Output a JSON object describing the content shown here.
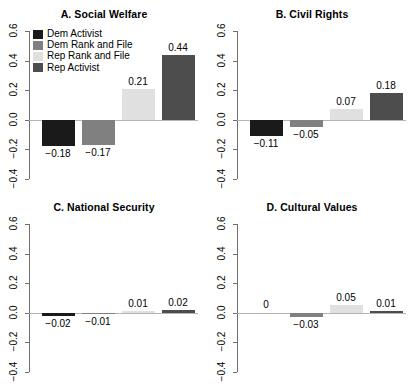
{
  "figure": {
    "width": 416,
    "height": 387,
    "background": "#ffffff",
    "layout": "2x2 grid of grouped bar panels"
  },
  "legend": {
    "position": "top-left of panel A",
    "entries": [
      {
        "label": "Dem Activist",
        "color": "#1a1a1a"
      },
      {
        "label": "Dem Rank and File",
        "color": "#808080"
      },
      {
        "label": "Rep Rank and File",
        "color": "#e0e0e0"
      },
      {
        "label": "Rep Activist",
        "color": "#4d4d4d"
      }
    ]
  },
  "axis": {
    "ticks": [
      "0.6",
      "0.4",
      "0.2",
      "0.0",
      "−0.2",
      "−0.4"
    ],
    "tick_values": [
      0.6,
      0.4,
      0.2,
      0.0,
      -0.2,
      -0.4
    ],
    "ylim": [
      -0.4,
      0.6
    ],
    "grid": false,
    "orientation": "rotated 90 degrees"
  },
  "chart_data": [
    {
      "type": "bar",
      "title": "A. Social Welfare",
      "categories": [
        "Dem Activist",
        "Dem Rank and File",
        "Rep Rank and File",
        "Rep Activist"
      ],
      "values": [
        -0.18,
        -0.17,
        0.21,
        0.44
      ],
      "labels": [
        "−0.18",
        "−0.17",
        "0.21",
        "0.44"
      ],
      "colors": [
        "#1a1a1a",
        "#808080",
        "#e0e0e0",
        "#4d4d4d"
      ],
      "xlabel": "",
      "ylabel": "",
      "ylim": [
        -0.4,
        0.6
      ]
    },
    {
      "type": "bar",
      "title": "B. Civil Rights",
      "categories": [
        "Dem Activist",
        "Dem Rank and File",
        "Rep Rank and File",
        "Rep Activist"
      ],
      "values": [
        -0.11,
        -0.05,
        0.07,
        0.18
      ],
      "labels": [
        "−0.11",
        "−0.05",
        "0.07",
        "0.18"
      ],
      "colors": [
        "#1a1a1a",
        "#808080",
        "#e0e0e0",
        "#4d4d4d"
      ],
      "xlabel": "",
      "ylabel": "",
      "ylim": [
        -0.4,
        0.6
      ]
    },
    {
      "type": "bar",
      "title": "C. National Security",
      "categories": [
        "Dem Activist",
        "Dem Rank and File",
        "Rep Rank and File",
        "Rep Activist"
      ],
      "values": [
        -0.02,
        -0.01,
        0.01,
        0.02
      ],
      "labels": [
        "−0.02",
        "−0.01",
        "0.01",
        "0.02"
      ],
      "colors": [
        "#1a1a1a",
        "#808080",
        "#e0e0e0",
        "#4d4d4d"
      ],
      "xlabel": "",
      "ylabel": "",
      "ylim": [
        -0.4,
        0.6
      ]
    },
    {
      "type": "bar",
      "title": "D. Cultural Values",
      "categories": [
        "Dem Activist",
        "Dem Rank and File",
        "Rep Rank and File",
        "Rep Activist"
      ],
      "values": [
        0,
        -0.03,
        0.05,
        0.01
      ],
      "labels": [
        "0",
        "−0.03",
        "0.05",
        "0.01"
      ],
      "colors": [
        "#1a1a1a",
        "#808080",
        "#e0e0e0",
        "#4d4d4d"
      ],
      "xlabel": "",
      "ylabel": "",
      "ylim": [
        -0.4,
        0.6
      ]
    }
  ]
}
